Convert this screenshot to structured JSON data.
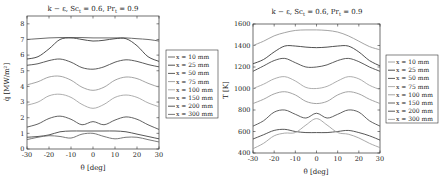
{
  "chart_data": [
    {
      "type": "line",
      "title": "k − ε, Sc_t = 0.6, Pr_t = 0.9",
      "xlabel": "θ [deg]",
      "ylabel": "q̇ [MW/m²]",
      "xlim": [
        -30,
        30
      ],
      "ylim": [
        0,
        8.5
      ],
      "xticks": [
        -30,
        -20,
        -10,
        0,
        10,
        20,
        30
      ],
      "yticks": [
        0,
        1,
        2,
        3,
        4,
        5,
        6,
        7,
        8
      ],
      "grid": false,
      "legend_position": "outside-right",
      "x": [
        -30,
        -25,
        -20,
        -15,
        -10,
        -5,
        0,
        5,
        10,
        15,
        20,
        25,
        30
      ],
      "series": [
        {
          "name": "x = 10 mm",
          "color": "#5a5a5a",
          "values": [
            7.0,
            7.05,
            7.1,
            7.12,
            7.12,
            7.12,
            7.1,
            7.1,
            7.1,
            7.1,
            7.05,
            7.0,
            6.9
          ]
        },
        {
          "name": "x = 25 mm",
          "color": "#3c3c3c",
          "values": [
            5.75,
            5.9,
            6.4,
            7.0,
            7.1,
            7.0,
            6.9,
            6.95,
            7.05,
            7.05,
            6.6,
            5.9,
            5.6
          ]
        },
        {
          "name": "x = 50 mm",
          "color": "#4a4a4a",
          "values": [
            5.35,
            5.45,
            5.65,
            5.75,
            5.55,
            5.2,
            5.1,
            5.25,
            5.55,
            5.7,
            5.6,
            5.4,
            5.25
          ]
        },
        {
          "name": "x = 75 mm",
          "color": "#9a9a9a",
          "values": [
            4.1,
            4.3,
            4.6,
            4.65,
            4.4,
            3.95,
            3.75,
            3.95,
            4.4,
            4.6,
            4.5,
            4.2,
            3.95
          ]
        },
        {
          "name": "x = 100 mm",
          "color": "#a5a5a5",
          "values": [
            2.8,
            3.0,
            3.4,
            3.5,
            3.3,
            2.85,
            2.6,
            2.85,
            3.3,
            3.45,
            3.3,
            2.95,
            2.7
          ]
        },
        {
          "name": "x = 150 mm",
          "color": "#505050",
          "values": [
            1.4,
            1.6,
            1.95,
            2.1,
            1.9,
            1.55,
            1.75,
            1.55,
            1.85,
            2.05,
            1.9,
            1.55,
            1.25
          ]
        },
        {
          "name": "x = 200 mm",
          "color": "#444444",
          "values": [
            0.75,
            0.8,
            0.9,
            1.1,
            1.15,
            1.15,
            1.15,
            1.15,
            1.15,
            1.1,
            0.95,
            0.8,
            0.65
          ]
        },
        {
          "name": "x = 300 mm",
          "color": "#6a6a6a",
          "values": [
            0.6,
            0.75,
            0.85,
            0.8,
            0.7,
            0.95,
            1.0,
            0.8,
            0.65,
            0.75,
            0.75,
            0.6,
            0.45
          ]
        }
      ]
    },
    {
      "type": "line",
      "title": "k − ε, Sc_t = 0.6, Pr_t = 0.9",
      "xlabel": "θ [deg]",
      "ylabel": "T [K]",
      "xlim": [
        -30,
        30
      ],
      "ylim": [
        400,
        1600
      ],
      "xticks": [
        -30,
        -20,
        -10,
        0,
        10,
        20,
        30
      ],
      "yticks": [
        400,
        600,
        800,
        1000,
        1200,
        1400,
        1600
      ],
      "grid": false,
      "legend_position": "outside-right",
      "x": [
        -30,
        -25,
        -20,
        -15,
        -10,
        -5,
        0,
        5,
        10,
        15,
        20,
        25,
        30
      ],
      "series": [
        {
          "name": "x = 10 mm",
          "color": "#9a9a9a",
          "values": [
            1400,
            1440,
            1490,
            1520,
            1540,
            1545,
            1545,
            1540,
            1525,
            1490,
            1440,
            1390,
            1360
          ]
        },
        {
          "name": "x = 25 mm",
          "color": "#3c3c3c",
          "values": [
            1230,
            1270,
            1340,
            1395,
            1395,
            1385,
            1380,
            1385,
            1395,
            1395,
            1340,
            1260,
            1210
          ]
        },
        {
          "name": "x = 50 mm",
          "color": "#4a4a4a",
          "values": [
            1160,
            1210,
            1260,
            1280,
            1240,
            1200,
            1200,
            1220,
            1260,
            1280,
            1250,
            1200,
            1160
          ]
        },
        {
          "name": "x = 75 mm",
          "color": "#a5a5a5",
          "values": [
            1000,
            1040,
            1090,
            1110,
            1070,
            1010,
            1000,
            1020,
            1070,
            1110,
            1090,
            1030,
            990
          ]
        },
        {
          "name": "x = 100 mm",
          "color": "#9a9a9a",
          "values": [
            860,
            900,
            950,
            970,
            940,
            880,
            860,
            880,
            940,
            970,
            950,
            900,
            860
          ]
        },
        {
          "name": "x = 150 mm",
          "color": "#505050",
          "values": [
            650,
            700,
            780,
            800,
            760,
            725,
            770,
            725,
            760,
            800,
            780,
            700,
            650
          ]
        },
        {
          "name": "x = 200 mm",
          "color": "#444444",
          "values": [
            530,
            570,
            610,
            620,
            600,
            590,
            590,
            590,
            600,
            610,
            590,
            560,
            520
          ]
        },
        {
          "name": "x = 300 mm",
          "color": "#a0a0a0",
          "values": [
            440,
            490,
            560,
            585,
            590,
            660,
            720,
            660,
            590,
            575,
            540,
            490,
            450
          ]
        }
      ]
    }
  ],
  "plots": [
    {
      "title": "k − ε, Sc",
      "title_sub": "t",
      "title_mid": " = 0.6, Pr",
      "title_sub2": "t",
      "title_end": " = 0.9",
      "xlabel": "θ [deg]",
      "ylabel": "q̇ [MW/m²]",
      "legend": [
        "x = 10 mm",
        "x = 25 mm",
        "x = 50 mm",
        "x = 75 mm",
        "x = 100 mm",
        "x = 150 mm",
        "x = 200 mm",
        "x = 300 mm"
      ]
    },
    {
      "title": "k − ε, Sc",
      "title_sub": "t",
      "title_mid": " = 0.6, Pr",
      "title_sub2": "t",
      "title_end": " = 0.9",
      "xlabel": "θ [deg]",
      "ylabel": "T [K]",
      "legend": [
        "x = 10 mm",
        "x = 25 mm",
        "x = 50 mm",
        "x = 75 mm",
        "x = 100 mm",
        "x = 150 mm",
        "x = 200 mm",
        "x = 300 mm"
      ]
    }
  ]
}
